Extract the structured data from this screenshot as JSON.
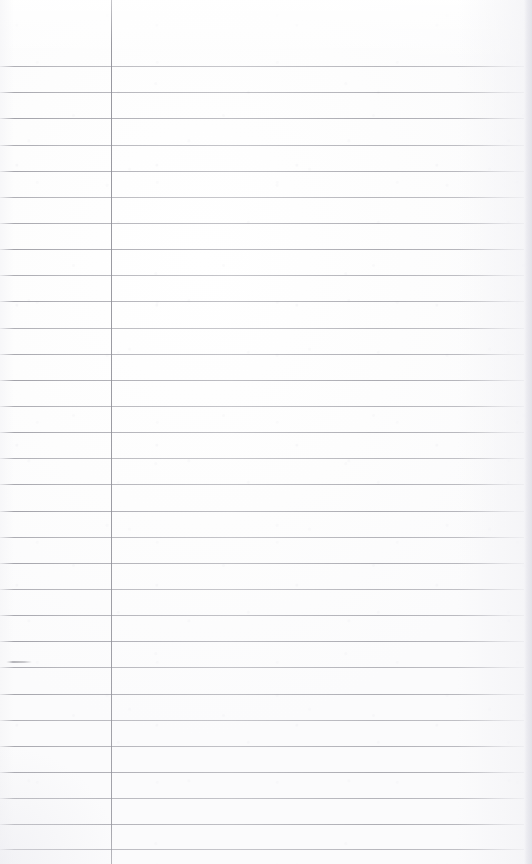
{
  "document": {
    "kind": "scanned-lined-notepad-page",
    "title": "Blank ruled notepad page",
    "width": 532,
    "height": 864,
    "content_text": "",
    "is_blank": true,
    "paper_color": "#fdfdfd",
    "rule_color": "#9a9aa2",
    "margin_rule_color": "#90909a"
  },
  "ruling": {
    "style": "wide-ruled",
    "line_count": 31,
    "first_line_y": 66,
    "line_spacing": 26.1,
    "line_start_x": 0,
    "line_end_x": 524,
    "line_thickness": 1,
    "lines_y": [
      66,
      92,
      118,
      145,
      171,
      197,
      223,
      249,
      275,
      301,
      328,
      354,
      380,
      406,
      432,
      458,
      484,
      511,
      537,
      563,
      589,
      615,
      641,
      667,
      694,
      720,
      746,
      772,
      798,
      824,
      849
    ]
  },
  "margin": {
    "vertical_rule_x": 111,
    "vertical_rule_top": 0,
    "vertical_rule_bottom": 864,
    "left_column_width": 111,
    "right_column_width": 421
  },
  "marks": {
    "pencil_smudge": {
      "label": "faint-pencil-mark",
      "x": 6,
      "y": 661,
      "width": 26,
      "height": 2
    }
  },
  "edges": {
    "right_shadow_x": 524,
    "right_shadow_width": 8,
    "header_blank_height": 66
  }
}
